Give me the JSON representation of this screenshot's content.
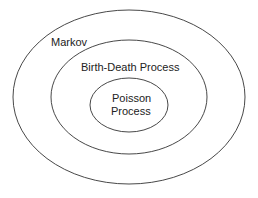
{
  "diagram": {
    "type": "nested-sets",
    "sets": [
      {
        "id": "markov",
        "label": "Markov",
        "cx": 129,
        "cy": 97,
        "rx": 116,
        "ry": 87
      },
      {
        "id": "birth-death",
        "label": "Birth-Death Process",
        "cx": 129,
        "cy": 97,
        "rx": 78,
        "ry": 57
      },
      {
        "id": "poisson",
        "label_line1": "Poisson",
        "label_line2": "Process",
        "cx": 129,
        "cy": 105,
        "rx": 39,
        "ry": 27
      }
    ],
    "stroke_color": "#333333"
  }
}
